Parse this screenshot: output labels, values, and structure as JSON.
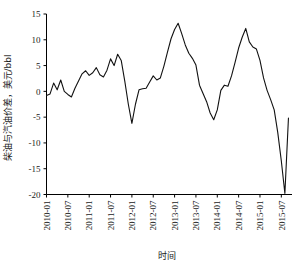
{
  "chart_data": {
    "type": "line",
    "title": "",
    "xlabel": "时间",
    "ylabel": "柴油与汽油价差，美元/bbl",
    "ylim": [
      -20,
      15
    ],
    "yticks": [
      -20,
      -15,
      -10,
      -5,
      0,
      5,
      10,
      15
    ],
    "ytick_labels": [
      "-20",
      "-15",
      "-10",
      "-5",
      "0",
      "5",
      "10",
      "15"
    ],
    "xlim": [
      "2010-01",
      "2015-10"
    ],
    "xticks": [
      "2010-01",
      "2010-07",
      "2011-01",
      "2011-07",
      "2012-01",
      "2012-07",
      "2013-01",
      "2013-07",
      "2014-01",
      "2014-07",
      "2015-01",
      "2015-07"
    ],
    "grid": false,
    "legend": null,
    "legend_position": "none",
    "series": [
      {
        "name": "柴油与汽油价差",
        "color": "#111111",
        "x": [
          "2010-01",
          "2010-02",
          "2010-03",
          "2010-04",
          "2010-05",
          "2010-06",
          "2010-07",
          "2010-08",
          "2010-09",
          "2010-10",
          "2010-11",
          "2010-12",
          "2011-01",
          "2011-02",
          "2011-03",
          "2011-04",
          "2011-05",
          "2011-06",
          "2011-07",
          "2011-08",
          "2011-09",
          "2011-10",
          "2011-11",
          "2011-12",
          "2012-01",
          "2012-02",
          "2012-03",
          "2012-04",
          "2012-05",
          "2012-06",
          "2012-07",
          "2012-08",
          "2012-09",
          "2012-10",
          "2012-11",
          "2012-12",
          "2013-01",
          "2013-02",
          "2013-03",
          "2013-04",
          "2013-05",
          "2013-06",
          "2013-07",
          "2013-08",
          "2013-09",
          "2013-10",
          "2013-11",
          "2013-12",
          "2014-01",
          "2014-02",
          "2014-03",
          "2014-04",
          "2014-05",
          "2014-06",
          "2014-07",
          "2014-08",
          "2014-09",
          "2014-10",
          "2014-11",
          "2014-12",
          "2015-01",
          "2015-02",
          "2015-03",
          "2015-04",
          "2015-05",
          "2015-06",
          "2015-07",
          "2015-08",
          "2015-09"
        ],
        "values": [
          -0.8,
          -0.5,
          1.6,
          0.3,
          2.2,
          0.0,
          -0.6,
          -1.1,
          0.6,
          2.0,
          3.4,
          4.0,
          3.1,
          3.6,
          4.6,
          3.2,
          2.8,
          4.1,
          6.3,
          5.0,
          7.2,
          6.0,
          2.0,
          -2.5,
          -6.2,
          -2.5,
          0.3,
          0.5,
          0.6,
          1.8,
          3.0,
          2.2,
          2.6,
          4.9,
          7.6,
          10.2,
          12.0,
          13.2,
          11.2,
          9.0,
          7.4,
          6.4,
          5.1,
          1.2,
          -0.4,
          -2.0,
          -4.2,
          -5.5,
          -3.6,
          0.2,
          1.2,
          1.0,
          3.0,
          5.6,
          8.4,
          10.5,
          12.2,
          9.6,
          8.6,
          8.2,
          6.0,
          2.6,
          0.2,
          -1.6,
          -3.6,
          -8.0,
          -13.5,
          -19.8,
          -5.2
        ]
      }
    ]
  },
  "axis": {
    "ylabel": "柴油与汽油价差，美元/bbl",
    "xlabel": "时间"
  }
}
